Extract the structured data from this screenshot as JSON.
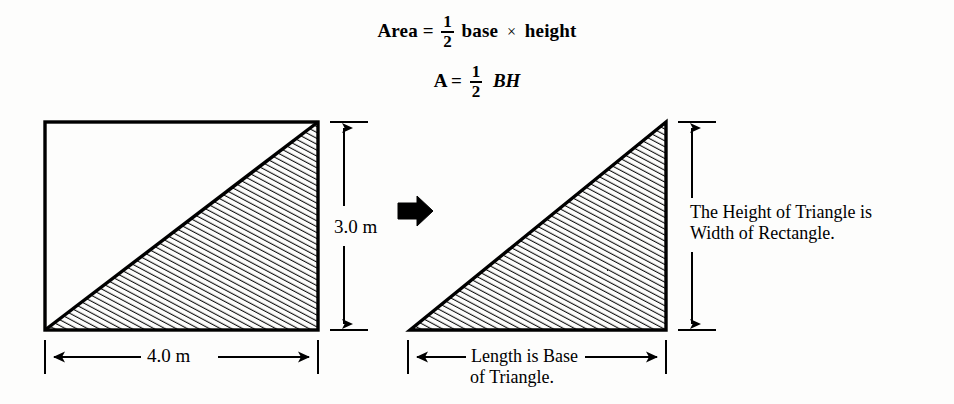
{
  "figure": {
    "title_formulas": {
      "line1": {
        "lead": "Area",
        "equals": "=",
        "fraction_numerator": "1",
        "fraction_denominator": "2",
        "term1": "base",
        "operator": "×",
        "term2": "height"
      },
      "line2": {
        "lead": "A",
        "equals": "=",
        "fraction_numerator": "1",
        "fraction_denominator": "2",
        "variables": "BH"
      }
    },
    "left_diagram": {
      "name": "rectangle-with-inscribed-triangle",
      "width_label": "4.0 m",
      "height_label": "3.0 m"
    },
    "transform_arrow": {
      "name": "right-pointing-block-arrow",
      "direction": "right"
    },
    "right_diagram": {
      "name": "right-triangle",
      "height_note": "The Height of Triangle is\nWidth of Rectangle.",
      "height_note_line1": "The Height of Triangle is",
      "height_note_line2": "Width of Rectangle.",
      "base_note_line1": "Length is Base",
      "base_note_line2": "of Triangle."
    },
    "colors": {
      "ink": "#000000",
      "paper": "#fdfdfc",
      "hatch": "#111111"
    }
  }
}
